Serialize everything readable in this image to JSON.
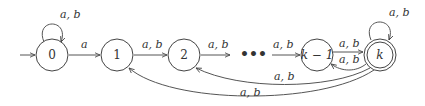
{
  "diagram": {
    "type": "finite-automaton",
    "states": [
      {
        "id": "0",
        "label": "0",
        "start": true,
        "accepting": false
      },
      {
        "id": "1",
        "label": "1",
        "start": false,
        "accepting": false
      },
      {
        "id": "2",
        "label": "2",
        "start": false,
        "accepting": false
      },
      {
        "id": "km1",
        "label": "k − 1",
        "start": false,
        "accepting": false
      },
      {
        "id": "k",
        "label": "k",
        "start": false,
        "accepting": true
      }
    ],
    "ellipsis": "•••",
    "edges": [
      {
        "from": "0",
        "to": "0",
        "label": "a, b",
        "kind": "self-loop"
      },
      {
        "from": "0",
        "to": "1",
        "label": "a"
      },
      {
        "from": "1",
        "to": "2",
        "label": "a, b"
      },
      {
        "from": "2",
        "to": "ellipsis",
        "label": "a, b"
      },
      {
        "from": "ellipsis",
        "to": "km1",
        "label": "a, b"
      },
      {
        "from": "km1",
        "to": "k",
        "label": "a, b"
      },
      {
        "from": "k",
        "to": "km1",
        "label": "a, b"
      },
      {
        "from": "k",
        "to": "k",
        "label": "a, b",
        "kind": "self-loop"
      },
      {
        "from": "k",
        "to": "2",
        "label": "a, b"
      },
      {
        "from": "k",
        "to": "1",
        "label": "a, b"
      }
    ]
  }
}
